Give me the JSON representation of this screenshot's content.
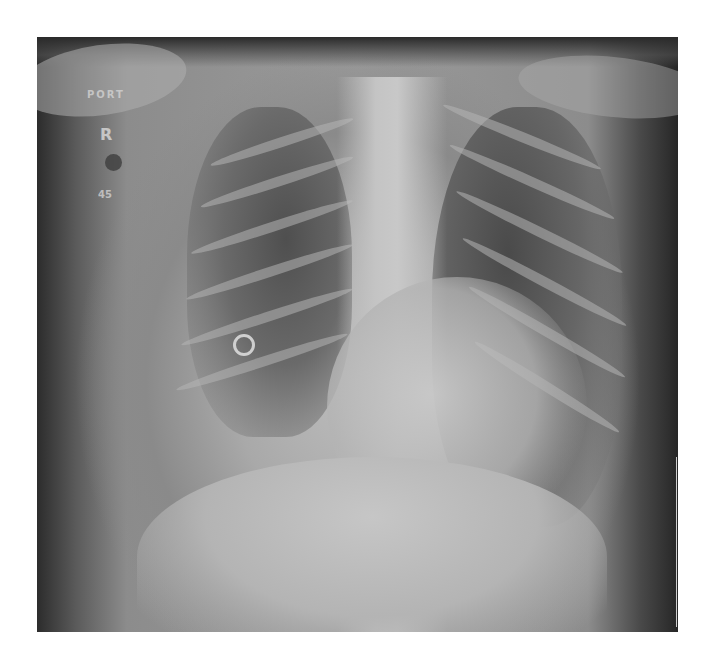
{
  "image": {
    "type": "chest radiograph",
    "projection": "portable frontal",
    "background_color": "#ffffff",
    "film_tone_colors": [
      "#262626",
      "#5a5a5a",
      "#9a9a9a",
      "#c8c8c8"
    ]
  },
  "markers": {
    "portable_label": "PORT",
    "side_marker": "R",
    "angle_label": "45"
  },
  "findings_visible": {
    "ring_object": "radiopaque ring in right mid-lung field"
  }
}
